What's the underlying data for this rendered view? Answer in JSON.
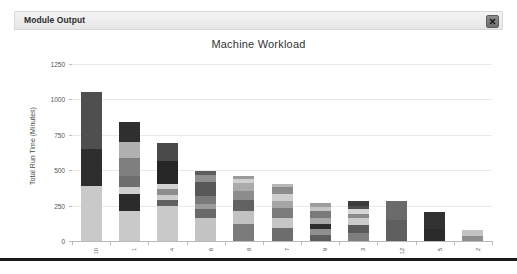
{
  "panel": {
    "title": "Module Output",
    "close_icon": "close-icon",
    "close_label": "x"
  },
  "chart_data": {
    "type": "bar",
    "stacked": true,
    "title": "Machine Workload",
    "xlabel": "",
    "ylabel": "Total Run Time (Minutes)",
    "ylim": [
      0,
      1250
    ],
    "yticks": [
      0,
      250,
      500,
      750,
      1000,
      1250
    ],
    "ytick_labels": [
      "0",
      "250",
      "500",
      "750",
      "1000",
      "1250"
    ],
    "grid": true,
    "legend": "none",
    "categories": [
      "10",
      "1",
      "4",
      "6",
      "8",
      "7",
      "9",
      "3",
      "12",
      "5",
      "2"
    ],
    "series": [
      {
        "name": "segment-1",
        "color": "#c9c9c9",
        "values": [
          390,
          215,
          245,
          165,
          120,
          95,
          40,
          55,
          145,
          85,
          35
        ]
      },
      {
        "name": "segment-2",
        "color": "#4a4a4a",
        "values": [
          260,
          115,
          45,
          60,
          95,
          65,
          45,
          60,
          0,
          0,
          0
        ]
      },
      {
        "name": "segment-3",
        "color": "#8a8a8a",
        "values": [
          400,
          50,
          35,
          40,
          75,
          70,
          35,
          45,
          135,
          120,
          45
        ]
      },
      {
        "name": "segment-4",
        "color": "#b5b5b5",
        "values": [
          0,
          80,
          40,
          55,
          60,
          50,
          40,
          30,
          0,
          0,
          0
        ]
      },
      {
        "name": "segment-5",
        "color": "#6e6e6e",
        "values": [
          0,
          125,
          140,
          95,
          60,
          55,
          50,
          35,
          0,
          0,
          0
        ]
      },
      {
        "name": "segment-6",
        "color": "#9e9e9e",
        "values": [
          0,
          115,
          60,
          55,
          30,
          45,
          30,
          25,
          0,
          0,
          0
        ]
      },
      {
        "name": "segment-7",
        "color": "#3a3a3a",
        "values": [
          0,
          140,
          125,
          25,
          20,
          25,
          30,
          30,
          0,
          0,
          0
        ]
      }
    ],
    "totals": [
      1050,
      840,
      690,
      495,
      460,
      405,
      270,
      280,
      280,
      205,
      80
    ]
  },
  "bars": [
    {
      "label": "10",
      "total": 1050,
      "segments": [
        {
          "value": 390,
          "color": "#c9c9c9"
        },
        {
          "value": 260,
          "color": "#2e2e2e"
        },
        {
          "value": 400,
          "color": "#4f4f4f"
        }
      ]
    },
    {
      "label": "1",
      "total": 840,
      "segments": [
        {
          "value": 215,
          "color": "#c9c9c9"
        },
        {
          "value": 115,
          "color": "#2b2b2b"
        },
        {
          "value": 50,
          "color": "#cfcfcf"
        },
        {
          "value": 80,
          "color": "#6e6e6e"
        },
        {
          "value": 125,
          "color": "#7f7f7f"
        },
        {
          "value": 115,
          "color": "#b0b0b0"
        },
        {
          "value": 140,
          "color": "#2f2f2f"
        }
      ]
    },
    {
      "label": "4",
      "total": 690,
      "segments": [
        {
          "value": 245,
          "color": "#c9c9c9"
        },
        {
          "value": 45,
          "color": "#606060"
        },
        {
          "value": 35,
          "color": "#cccccc"
        },
        {
          "value": 40,
          "color": "#8c8c8c"
        },
        {
          "value": 40,
          "color": "#d2d2d2"
        },
        {
          "value": 160,
          "color": "#262626"
        },
        {
          "value": 125,
          "color": "#4a4a4a"
        }
      ]
    },
    {
      "label": "6",
      "total": 495,
      "segments": [
        {
          "value": 165,
          "color": "#c4c4c4"
        },
        {
          "value": 60,
          "color": "#6a6a6a"
        },
        {
          "value": 40,
          "color": "#9b9b9b"
        },
        {
          "value": 55,
          "color": "#7a7a7a"
        },
        {
          "value": 95,
          "color": "#585858"
        },
        {
          "value": 55,
          "color": "#8f8f8f"
        },
        {
          "value": 25,
          "color": "#5c5c5c"
        }
      ]
    },
    {
      "label": "8",
      "total": 460,
      "segments": [
        {
          "value": 120,
          "color": "#7b7b7b"
        },
        {
          "value": 95,
          "color": "#c2c2c2"
        },
        {
          "value": 75,
          "color": "#626262"
        },
        {
          "value": 60,
          "color": "#8d8d8d"
        },
        {
          "value": 60,
          "color": "#ababab"
        },
        {
          "value": 30,
          "color": "#d0d0d0"
        },
        {
          "value": 20,
          "color": "#9a9a9a"
        }
      ]
    },
    {
      "label": "7",
      "total": 405,
      "segments": [
        {
          "value": 95,
          "color": "#6d6d6d"
        },
        {
          "value": 65,
          "color": "#c6c6c6"
        },
        {
          "value": 70,
          "color": "#7c7c7c"
        },
        {
          "value": 50,
          "color": "#a6a6a6"
        },
        {
          "value": 55,
          "color": "#cecece"
        },
        {
          "value": 45,
          "color": "#8b8b8b"
        },
        {
          "value": 25,
          "color": "#b6b6b6"
        }
      ]
    },
    {
      "label": "9",
      "total": 270,
      "segments": [
        {
          "value": 40,
          "color": "#5e5e5e"
        },
        {
          "value": 45,
          "color": "#8f8f8f"
        },
        {
          "value": 35,
          "color": "#2d2d2d"
        },
        {
          "value": 40,
          "color": "#a8a8a8"
        },
        {
          "value": 50,
          "color": "#7a7a7a"
        },
        {
          "value": 30,
          "color": "#c4c4c4"
        },
        {
          "value": 30,
          "color": "#9d9d9d"
        }
      ]
    },
    {
      "label": "3",
      "total": 280,
      "segments": [
        {
          "value": 55,
          "color": "#7e7e7e"
        },
        {
          "value": 60,
          "color": "#5a5a5a"
        },
        {
          "value": 45,
          "color": "#cbcbcb"
        },
        {
          "value": 30,
          "color": "#8a8a8a"
        },
        {
          "value": 35,
          "color": "#d5d5d5"
        },
        {
          "value": 25,
          "color": "#4d4d4d"
        },
        {
          "value": 30,
          "color": "#3b3b3b"
        }
      ]
    },
    {
      "label": "12",
      "total": 280,
      "segments": [
        {
          "value": 145,
          "color": "#5f5f5f"
        },
        {
          "value": 135,
          "color": "#6b6b6b"
        }
      ]
    },
    {
      "label": "5",
      "total": 205,
      "segments": [
        {
          "value": 85,
          "color": "#2b2b2b"
        },
        {
          "value": 120,
          "color": "#313131"
        }
      ]
    },
    {
      "label": "2",
      "total": 80,
      "segments": [
        {
          "value": 35,
          "color": "#8e8e8e"
        },
        {
          "value": 45,
          "color": "#c3c3c3"
        }
      ]
    }
  ]
}
